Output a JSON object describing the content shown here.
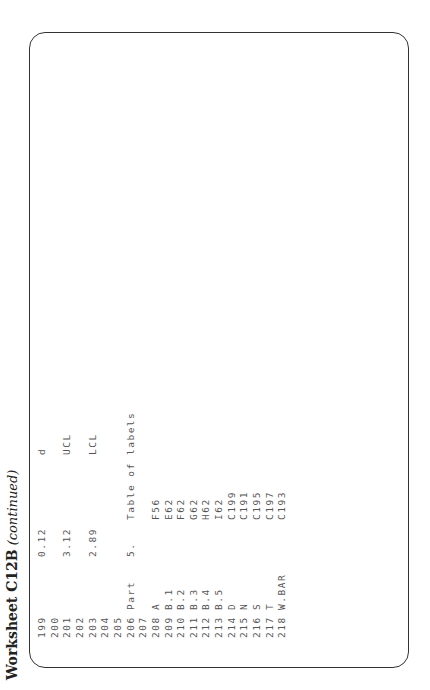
{
  "title": {
    "main": "Worksheet C12B",
    "continued": "(continued)"
  },
  "lines": [
    {
      "n": "199",
      "c2": "",
      "c3": "0.12",
      "c4": "",
      "c5": "d"
    },
    {
      "n": "200",
      "c2": "",
      "c3": "",
      "c4": "",
      "c5": ""
    },
    {
      "n": "201",
      "c2": "",
      "c3": "3.12",
      "c4": "",
      "c5": "UCL"
    },
    {
      "n": "202",
      "c2": "",
      "c3": "",
      "c4": "",
      "c5": ""
    },
    {
      "n": "203",
      "c2": "",
      "c3": "2.89",
      "c4": "",
      "c5": "LCL"
    },
    {
      "n": "204",
      "c2": "",
      "c3": "",
      "c4": "",
      "c5": ""
    },
    {
      "n": "205",
      "c2": "",
      "c3": "",
      "c4": "",
      "c5": ""
    },
    {
      "n": "206",
      "c2": "Part",
      "c3": "5.",
      "c4": "Table of labels",
      "c5": ""
    },
    {
      "n": "207",
      "c2": "",
      "c3": "",
      "c4": "",
      "c5": ""
    },
    {
      "n": "208",
      "c2": "A",
      "c3": "",
      "c4": "F56",
      "c5": ""
    },
    {
      "n": "209",
      "c2": "B.1",
      "c3": "",
      "c4": "E62",
      "c5": ""
    },
    {
      "n": "210",
      "c2": "B.2",
      "c3": "",
      "c4": "F62",
      "c5": ""
    },
    {
      "n": "211",
      "c2": "B.3",
      "c3": "",
      "c4": "G62",
      "c5": ""
    },
    {
      "n": "212",
      "c2": "B.4",
      "c3": "",
      "c4": "H62",
      "c5": ""
    },
    {
      "n": "213",
      "c2": "B.5",
      "c3": "",
      "c4": "I62",
      "c5": ""
    },
    {
      "n": "214",
      "c2": "D",
      "c3": "",
      "c4": "C199",
      "c5": ""
    },
    {
      "n": "215",
      "c2": "N",
      "c3": "",
      "c4": "C191",
      "c5": ""
    },
    {
      "n": "216",
      "c2": "S",
      "c3": "",
      "c4": "C195",
      "c5": ""
    },
    {
      "n": "217",
      "c2": "T",
      "c3": "",
      "c4": "C197",
      "c5": ""
    },
    {
      "n": "218",
      "c2": "W.BAR",
      "c3": "",
      "c4": "C193",
      "c5": ""
    }
  ]
}
